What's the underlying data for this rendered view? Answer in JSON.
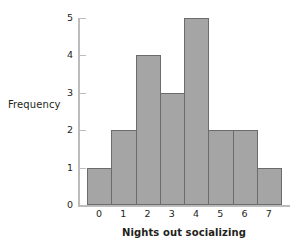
{
  "chart_data": {
    "type": "bar",
    "title": "",
    "subtitle": "",
    "xlabel": "Nights out socializing",
    "ylabel": "Frequency",
    "categories": [
      "0",
      "1",
      "2",
      "3",
      "4",
      "5",
      "6",
      "7"
    ],
    "values": [
      1,
      2,
      4,
      3,
      5,
      2,
      2,
      1
    ],
    "series": [
      {
        "name": "Frequency",
        "values": [
          1,
          2,
          4,
          3,
          5,
          2,
          2,
          1
        ]
      }
    ],
    "ylim": [
      0,
      5
    ],
    "xlim": [
      -0.5,
      7.5
    ],
    "yticks": [
      "0",
      "1",
      "2",
      "3",
      "4",
      "5"
    ],
    "ytick_values": [
      0,
      1,
      2,
      3,
      4,
      5
    ],
    "xticks": [
      "0",
      "1",
      "2",
      "3",
      "4",
      "5",
      "6",
      "7"
    ],
    "grid": false,
    "legend": false,
    "legend_position": "none",
    "bar_fill_color": "#a5a5a5",
    "bar_edge_color": "#6b6b6b",
    "axis_color": "#bcbcbc",
    "text_color": "#231f20",
    "background_color": "#ffffff"
  }
}
